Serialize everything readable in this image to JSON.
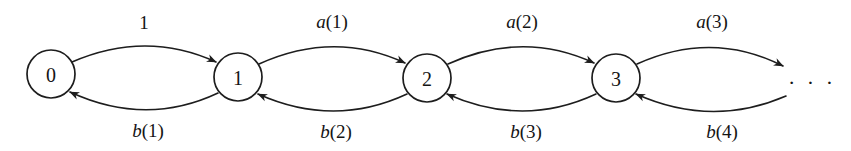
{
  "diagram": {
    "type": "state-transition-diagram",
    "title": "",
    "background_color": "#ffffff",
    "stroke_color": "#1d1d1d",
    "text_color": "#141414",
    "nodes": [
      {
        "id": "state-0",
        "label": "0",
        "cx": 51,
        "cy": 74,
        "r": 24
      },
      {
        "id": "state-1",
        "label": "1",
        "cx": 238,
        "cy": 77,
        "r": 24
      },
      {
        "id": "state-2",
        "label": "2",
        "cx": 427,
        "cy": 78,
        "r": 24
      },
      {
        "id": "state-3",
        "label": "3",
        "cx": 616,
        "cy": 78,
        "r": 24
      }
    ],
    "continuation": {
      "label": "· · ·",
      "x": 812,
      "y": 82
    },
    "edges": [
      {
        "id": "edge-0-to-1",
        "from": "0",
        "to": "1",
        "direction": "forward",
        "label": "1",
        "label_var": "",
        "label_rest": "1",
        "label_x": 144,
        "label_y": 22
      },
      {
        "id": "edge-1-to-0",
        "from": "1",
        "to": "0",
        "direction": "backward",
        "label": "b(1)",
        "label_var": "b",
        "label_rest": "(1)",
        "label_x": 148,
        "label_y": 130
      },
      {
        "id": "edge-1-to-2",
        "from": "1",
        "to": "2",
        "direction": "forward",
        "label": "a(1)",
        "label_var": "a",
        "label_rest": "(1)",
        "label_x": 332,
        "label_y": 21
      },
      {
        "id": "edge-2-to-1",
        "from": "2",
        "to": "1",
        "direction": "backward",
        "label": "b(2)",
        "label_var": "b",
        "label_rest": "(2)",
        "label_x": 336,
        "label_y": 131
      },
      {
        "id": "edge-2-to-3",
        "from": "2",
        "to": "3",
        "direction": "forward",
        "label": "a(2)",
        "label_var": "a",
        "label_rest": "(2)",
        "label_x": 522,
        "label_y": 21
      },
      {
        "id": "edge-3-to-2",
        "from": "3",
        "to": "2",
        "direction": "backward",
        "label": "b(3)",
        "label_var": "b",
        "label_rest": "(3)",
        "label_x": 526,
        "label_y": 131
      },
      {
        "id": "edge-3-to-next",
        "from": "3",
        "to": "...",
        "direction": "forward",
        "label": "a(3)",
        "label_var": "a",
        "label_rest": "(3)",
        "label_x": 712,
        "label_y": 21
      },
      {
        "id": "edge-next-to-3",
        "from": "...",
        "to": "3",
        "direction": "backward",
        "label": "b(4)",
        "label_var": "b",
        "label_rest": "(4)",
        "label_x": 722,
        "label_y": 131
      }
    ]
  }
}
